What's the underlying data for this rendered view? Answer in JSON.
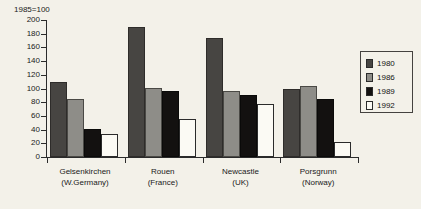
{
  "chart_data": {
    "type": "bar",
    "title": "1985=100",
    "xlabel": "",
    "ylabel": "",
    "ylim": [
      0,
      200
    ],
    "yticks": [
      0,
      20,
      40,
      60,
      80,
      100,
      120,
      140,
      160,
      180,
      200
    ],
    "grid": false,
    "legend_position": "right",
    "categories": [
      "Gelsenkirchen (W.Germany)",
      "Rouen (France)",
      "Newcastle (UK)",
      "Porsgrunn (Norway)"
    ],
    "category_lines": [
      [
        "Gelsenkirchen",
        "(W.Germany)"
      ],
      [
        "Rouen",
        "(France)"
      ],
      [
        "Newcastle",
        "(UK)"
      ],
      [
        "Porsgrunn",
        "(Norway)"
      ]
    ],
    "series": [
      {
        "name": "1980",
        "color": "#474542",
        "values": [
          110,
          190,
          174,
          99
        ]
      },
      {
        "name": "1986",
        "color": "#8e8d88",
        "values": [
          85,
          101,
          97,
          104
        ]
      },
      {
        "name": "1989",
        "color": "#131110",
        "values": [
          41,
          96,
          91,
          85
        ]
      },
      {
        "name": "1992",
        "color": "#fbfaf4",
        "values": [
          34,
          56,
          78,
          22
        ]
      }
    ]
  },
  "legend": {
    "entries": [
      {
        "label": "1980",
        "color": "#474542"
      },
      {
        "label": "1986",
        "color": "#8e8d88"
      },
      {
        "label": "1989",
        "color": "#131110"
      },
      {
        "label": "1992",
        "color": "#fbfaf4"
      }
    ]
  },
  "colors": {
    "background": "#f3f1e9",
    "axis": "#2b2b2b",
    "text": "#1a1a1a"
  }
}
